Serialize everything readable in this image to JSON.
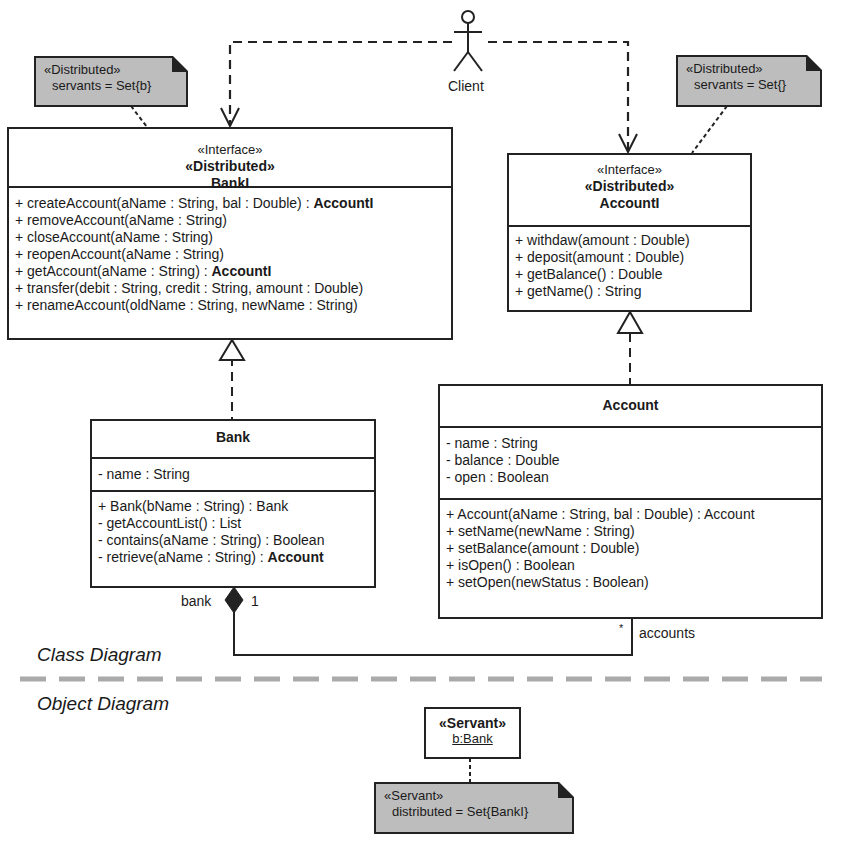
{
  "actor": {
    "label": "Client"
  },
  "notes": {
    "banki_note": {
      "line1": "«Distributed»",
      "line2": "servants = Set{b}"
    },
    "accounti_note": {
      "line1": "«Distributed»",
      "line2": "servants = Set{}"
    },
    "servant_note": {
      "line1": "«Servant»",
      "line2": "distributed = Set{BankI}"
    }
  },
  "classes": {
    "banki": {
      "stereotype1": "«Interface»",
      "stereotype2": "«Distributed»",
      "name": "BankI",
      "operations": [
        {
          "text": "+ createAccount(aName : String, bal : Double) : ",
          "bold": "AccountI"
        },
        {
          "text": "+ removeAccount(aName : String)",
          "bold": ""
        },
        {
          "text": "+ closeAccount(aName : String)",
          "bold": ""
        },
        {
          "text": "+ reopenAccount(aName : String)",
          "bold": ""
        },
        {
          "text": "+ getAccount(aName : String) : ",
          "bold": "AccountI"
        },
        {
          "text": "+ transfer(debit : String, credit : String, amount : Double)",
          "bold": ""
        },
        {
          "text": "+ renameAccount(oldName : String, newName : String)",
          "bold": ""
        }
      ]
    },
    "accounti": {
      "stereotype1": "«Interface»",
      "stereotype2": "«Distributed»",
      "name": "AccountI",
      "operations": [
        {
          "text": "+ withdaw(amount : Double)",
          "bold": ""
        },
        {
          "text": "+ deposit(amount : Double)",
          "bold": ""
        },
        {
          "text": "+ getBalance() : Double",
          "bold": ""
        },
        {
          "text": "+ getName() : String",
          "bold": ""
        }
      ]
    },
    "bank": {
      "name": "Bank",
      "attributes": [
        "- name : String"
      ],
      "operations": [
        {
          "text": "+ Bank(bName : String) : Bank",
          "bold": ""
        },
        {
          "text": "- getAccountList() : List",
          "bold": ""
        },
        {
          "text": "- contains(aName : String) : Boolean",
          "bold": ""
        },
        {
          "text": "- retrieve(aName : String) : ",
          "bold": "Account"
        }
      ]
    },
    "account": {
      "name": "Account",
      "attributes": [
        "- name : String",
        "- balance : Double",
        "- open : Boolean"
      ],
      "operations": [
        {
          "text": "+ Account(aName : String, bal : Double) : Account",
          "bold": ""
        },
        {
          "text": "+ setName(newName : String)",
          "bold": ""
        },
        {
          "text": "+ setBalance(amount : Double)",
          "bold": ""
        },
        {
          "text": "+ isOpen() : Boolean",
          "bold": ""
        },
        {
          "text": "+ setOpen(newStatus : Boolean)",
          "bold": ""
        }
      ]
    }
  },
  "association": {
    "bank_role": "bank",
    "bank_multiplicity": "1",
    "accounts_multiplicity": "*",
    "accounts_role": "accounts"
  },
  "sections": {
    "class_diagram": "Class Diagram",
    "object_diagram": "Object Diagram"
  },
  "object": {
    "stereotype": "«Servant»",
    "name": "b:Bank"
  },
  "colors": {
    "note_fill": "#bdbdbd",
    "line": "#222222",
    "divider": "#aaaaaa"
  }
}
